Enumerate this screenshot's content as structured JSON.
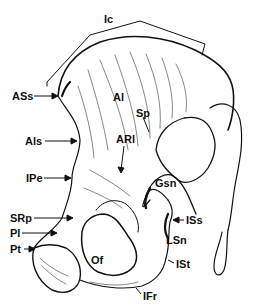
{
  "figure": {
    "labels": [
      {
        "id": "Ic",
        "text": "Ic",
        "x": 104,
        "y": 14
      },
      {
        "id": "ASs",
        "text": "ASs",
        "x": 12,
        "y": 92
      },
      {
        "id": "Al",
        "text": "Al",
        "x": 113,
        "y": 92
      },
      {
        "id": "Sp",
        "text": "Sp",
        "x": 136,
        "y": 108
      },
      {
        "id": "ARl",
        "text": "ARl",
        "x": 116,
        "y": 134
      },
      {
        "id": "Als",
        "text": "Als",
        "x": 25,
        "y": 137
      },
      {
        "id": "IPe",
        "text": "IPe",
        "x": 26,
        "y": 174
      },
      {
        "id": "Gsn",
        "text": "Gsn",
        "x": 155,
        "y": 178
      },
      {
        "id": "SRp",
        "text": "SRp",
        "x": 10,
        "y": 214
      },
      {
        "id": "ISs",
        "text": "ISs",
        "x": 186,
        "y": 216
      },
      {
        "id": "Pl",
        "text": "Pl",
        "x": 10,
        "y": 229
      },
      {
        "id": "LSn",
        "text": "LSn",
        "x": 166,
        "y": 235
      },
      {
        "id": "Pt",
        "text": "Pt",
        "x": 10,
        "y": 245
      },
      {
        "id": "Of",
        "text": "Of",
        "x": 91,
        "y": 255
      },
      {
        "id": "ISt",
        "text": "ISt",
        "x": 176,
        "y": 260
      },
      {
        "id": "IFr",
        "text": "IFr",
        "x": 143,
        "y": 291
      }
    ]
  }
}
